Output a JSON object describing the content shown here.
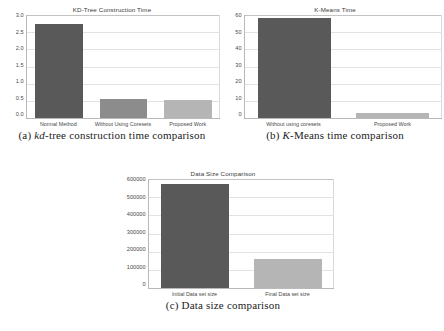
{
  "page": {
    "top_cut_text": "",
    "background": "#ffffff",
    "bar_dark_color": "#595959",
    "bar_light_color": "#b5b5b5",
    "grid_color": "#e2e2e2",
    "axis_color": "#b9b9b9"
  },
  "figures": [
    {
      "id": "a",
      "caption_prefix": "(a)",
      "caption_italic": "kd",
      "caption_rest": "-tree construction time comparison",
      "caption_full": "(a) kd-tree construction time comparison"
    },
    {
      "id": "b",
      "caption_prefix": "(b)",
      "caption_italic": "K",
      "caption_rest": "-Means time comparison",
      "caption_full": "(b) K-Means time comparison"
    },
    {
      "id": "c",
      "caption_prefix": "(c)",
      "caption_italic": "",
      "caption_rest": "Data size comparison",
      "caption_full": "(c) Data size comparison"
    }
  ],
  "chart_data": [
    {
      "id": "a",
      "type": "bar",
      "title": "KD-Tree Construction Time",
      "xlabel": "",
      "ylabel": "",
      "categories": [
        "Normal Method",
        "Without Using Coresets",
        "Proposed Work"
      ],
      "values": [
        2.75,
        0.55,
        0.52
      ],
      "colors": [
        "#595959",
        "#8c8c8c",
        "#b5b5b5"
      ],
      "ylim": [
        0.0,
        3.0
      ],
      "yticks": [
        "3.0",
        "2.5",
        "2.0",
        "1.5",
        "1.0",
        "0.5",
        "0.0"
      ],
      "ytick_values": [
        3.0,
        2.5,
        2.0,
        1.5,
        1.0,
        0.5,
        0.0
      ],
      "grid": true,
      "legend": "none"
    },
    {
      "id": "b",
      "type": "bar",
      "title": "K-Means Time",
      "xlabel": "",
      "ylabel": "",
      "categories": [
        "Without using coresets",
        "Proposed Work"
      ],
      "values": [
        58,
        3
      ],
      "colors": [
        "#595959",
        "#b5b5b5"
      ],
      "ylim": [
        0,
        60
      ],
      "yticks": [
        "60",
        "50",
        "40",
        "30",
        "20",
        "10",
        "0"
      ],
      "ytick_values": [
        60,
        50,
        40,
        30,
        20,
        10,
        0
      ],
      "grid": true,
      "legend": "none"
    },
    {
      "id": "c",
      "type": "bar",
      "title": "Data Size Comparison",
      "xlabel": "",
      "ylabel": "",
      "categories": [
        "Initial Data set size",
        "Final Data set size"
      ],
      "values": [
        575000,
        160000
      ],
      "colors": [
        "#595959",
        "#b5b5b5"
      ],
      "ylim": [
        0,
        600000
      ],
      "yticks": [
        "600000",
        "500000",
        "400000",
        "300000",
        "200000",
        "100000",
        "0"
      ],
      "ytick_values": [
        600000,
        500000,
        400000,
        300000,
        200000,
        100000,
        0
      ],
      "grid": true,
      "legend": "none"
    }
  ]
}
